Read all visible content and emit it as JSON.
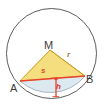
{
  "figure": {
    "type": "geometry-diagram",
    "background_color": "#ffffff",
    "circle": {
      "name": "circle-outline",
      "center_x": 51.5,
      "center_y": 53.5,
      "radius": 45,
      "stroke_color": "#5a5a5a",
      "stroke_width": 1,
      "fill": "none"
    },
    "segment": {
      "name": "circular-segment",
      "fill_color": "#dce9f0",
      "stroke_color": "#9aa8b0"
    },
    "triangle": {
      "name": "triangle-AMB",
      "fill_color": "#f5de7e",
      "stroke_color": "#c9a227",
      "vertices": {
        "M": {
          "x": 50,
          "y": 50
        },
        "A": {
          "x": 20,
          "y": 81
        },
        "B": {
          "x": 85,
          "y": 76
        }
      }
    },
    "chord": {
      "name": "chord-AB",
      "color": "#e8432b",
      "width": 1.6
    },
    "height_line": {
      "name": "height-h-line",
      "color": "#e8432b",
      "width": 1.4,
      "from": {
        "x": 56,
        "y": 78
      },
      "to": {
        "x": 56,
        "y": 97
      }
    },
    "labels": [
      {
        "id": "M",
        "text": "M",
        "role": "center-point-label",
        "color": "#3d3d3d"
      },
      {
        "id": "A",
        "text": "A",
        "role": "chord-endpoint-label",
        "color": "#3d3d3d"
      },
      {
        "id": "B",
        "text": "B",
        "role": "chord-endpoint-label",
        "color": "#3d3d3d"
      },
      {
        "id": "r",
        "text": "r",
        "role": "radius-label",
        "color": "#8a7d3a"
      },
      {
        "id": "s",
        "text": "s",
        "role": "chord-length-label",
        "color": "#d4562a"
      },
      {
        "id": "h",
        "text": "h",
        "role": "segment-height-label",
        "color": "#e0392b"
      }
    ]
  },
  "labels": {
    "M": "M",
    "A": "A",
    "B": "B",
    "r": "r",
    "s": "s",
    "h": "h"
  }
}
